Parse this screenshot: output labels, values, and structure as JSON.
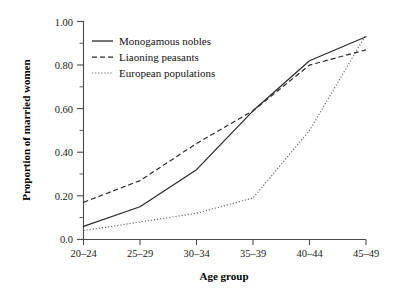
{
  "chart_data": {
    "type": "line",
    "title": "",
    "xlabel": "Age group",
    "ylabel": "Proportion of married women",
    "categories": [
      "20–24",
      "25–29",
      "30–34",
      "35–39",
      "40–44",
      "45–49"
    ],
    "series": [
      {
        "name": "Monogamous nobles",
        "style": "solid",
        "color": "#2b2b2b",
        "values": [
          0.06,
          0.15,
          0.32,
          0.59,
          0.82,
          0.93
        ]
      },
      {
        "name": "Liaoning peasants",
        "style": "dashed",
        "color": "#2b2b2b",
        "values": [
          0.17,
          0.27,
          0.44,
          0.59,
          0.8,
          0.87
        ]
      },
      {
        "name": "European populations",
        "style": "dotted",
        "color": "#666666",
        "values": [
          0.04,
          0.08,
          0.12,
          0.19,
          0.5,
          0.94
        ]
      }
    ],
    "ylim": [
      0.0,
      1.0
    ],
    "y_ticks": [
      0.0,
      0.2,
      0.4,
      0.6,
      0.8,
      1.0
    ],
    "y_tick_labels": [
      "0.0",
      "0.20",
      "0.40",
      "0.60",
      "0.80",
      "1.00"
    ],
    "y_minor_ticks": [
      0.1,
      0.3,
      0.5,
      0.7,
      0.9
    ],
    "grid": false,
    "legend_position": "upper left",
    "legend_entries": [
      "Monogamous nobles",
      "Liaoning peasants",
      "European populations"
    ]
  },
  "legend": {
    "items": [
      {
        "label": "Monogamous nobles"
      },
      {
        "label": "Liaoning peasants"
      },
      {
        "label": "European populations"
      }
    ]
  },
  "axes": {
    "y_title": "Proportion of married women",
    "x_title": "Age group",
    "y_labels": [
      "1.00",
      "0.80",
      "0.60",
      "0.40",
      "0.20",
      "0.0"
    ],
    "x_labels": [
      "20–24",
      "25–29",
      "30–34",
      "35–39",
      "40–44",
      "45–49"
    ]
  }
}
